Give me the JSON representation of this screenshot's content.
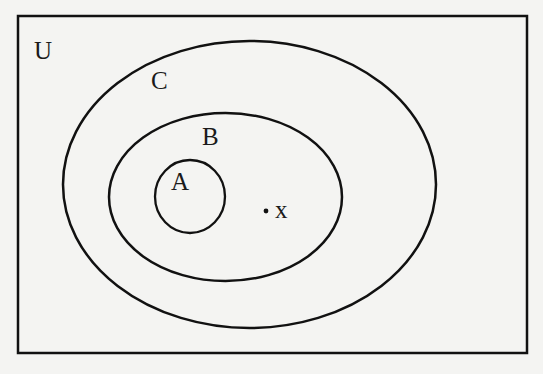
{
  "diagram": {
    "type": "venn-diagram",
    "universe": {
      "label": "U"
    },
    "sets": [
      {
        "name": "C",
        "label": "C",
        "contains": [
          "B"
        ]
      },
      {
        "name": "B",
        "label": "B",
        "contains": [
          "A"
        ]
      },
      {
        "name": "A",
        "label": "A",
        "contains": []
      }
    ],
    "elements": [
      {
        "label": "x",
        "in_sets": [
          "B",
          "C"
        ],
        "not_in_sets": [
          "A"
        ]
      }
    ],
    "colors": {
      "stroke": "#111111",
      "background": "#f4f4f2"
    }
  }
}
